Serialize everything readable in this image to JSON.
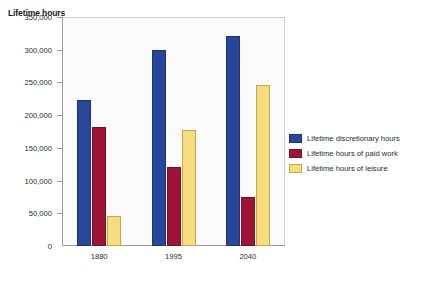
{
  "chart_data": {
    "type": "bar",
    "title": "",
    "ylabel": "Lifetime hours",
    "xlabel": "",
    "ylim": [
      0,
      350000
    ],
    "ytick_step": 50000,
    "grid": false,
    "legend_position": "right",
    "categories": [
      "1880",
      "1995",
      "2040"
    ],
    "ytick_labels": [
      "0",
      "50,000",
      "100,000",
      "150,000",
      "200,000",
      "250,000",
      "300,000",
      "350,000"
    ],
    "series": [
      {
        "name": "Lifetime discretionary hours",
        "color": "#27479b",
        "values": [
          223000,
          300000,
          321000
        ]
      },
      {
        "name": "Lifetime hours of paid work",
        "color": "#9d1436",
        "values": [
          182000,
          121000,
          75000
        ]
      },
      {
        "name": "Lifetime hours of leisure",
        "color": "#f7dd82",
        "values": [
          46000,
          177000,
          246000
        ]
      }
    ]
  },
  "legend": {
    "items": [
      {
        "label": "Lifetime discretionary hours",
        "swatch": "blue"
      },
      {
        "label": "Lifetime hours of paid work",
        "swatch": "red"
      },
      {
        "label": "Lifetime hours of leisure",
        "swatch": "yellow"
      }
    ]
  }
}
